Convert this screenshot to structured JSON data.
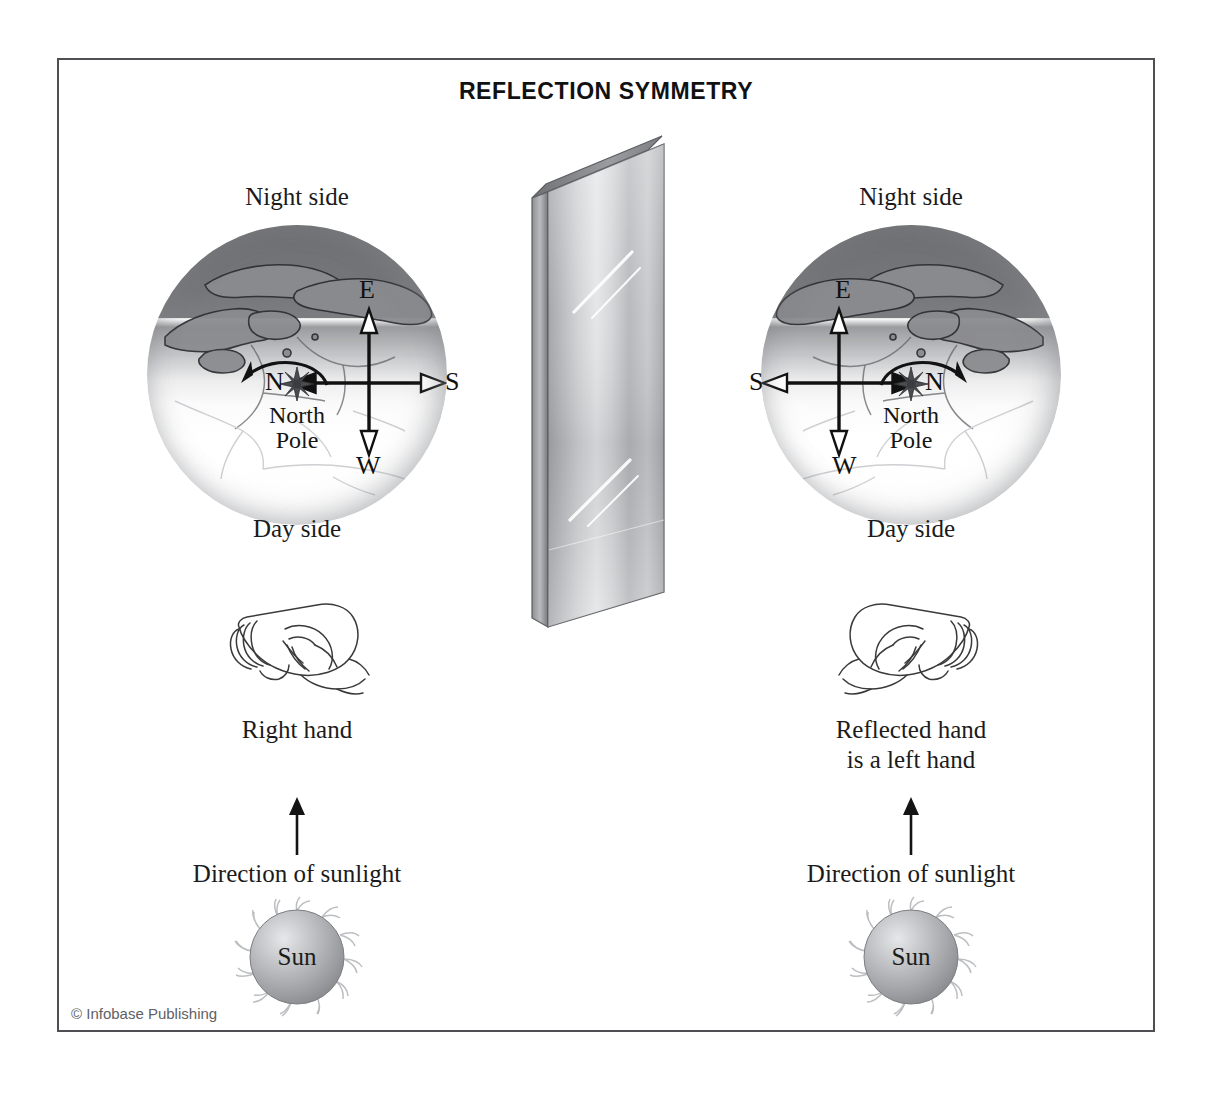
{
  "figure": {
    "title": "REFLECTION SYMMETRY",
    "credit": "© Infobase Publishing",
    "frame_color": "#4d4f52",
    "background": "#ffffff"
  },
  "left_panel": {
    "name": "original",
    "night_label": "Night side",
    "day_label": "Day side",
    "pole_label_line1": "North",
    "pole_label_line2": "Pole",
    "compass": {
      "up": "E",
      "down": "W",
      "left": "N",
      "right": "S"
    },
    "rotation_arrow_direction": "counterclockwise-to-left",
    "hand_caption_line1": "Right hand",
    "hand_caption_line2": "",
    "sunlight_label": "Direction of sunlight",
    "sun_label": "Sun"
  },
  "right_panel": {
    "name": "reflection",
    "night_label": "Night side",
    "day_label": "Day side",
    "pole_label_line1": "North",
    "pole_label_line2": "Pole",
    "compass": {
      "up": "E",
      "down": "W",
      "left": "S",
      "right": "N"
    },
    "rotation_arrow_direction": "clockwise-to-right",
    "hand_caption_line1": "Reflected hand",
    "hand_caption_line2": "is a left hand",
    "sunlight_label": "Direction of sunlight",
    "sun_label": "Sun"
  },
  "mirror": {
    "name": "mirror-panel",
    "highlight_count": 2
  },
  "colors": {
    "night": "#6f7073",
    "day": "#ffffff",
    "ink": "#1b1b1b",
    "mirror_light": "#e9eaec",
    "mirror_dark": "#8d8f93",
    "sun_body": "#a9abae"
  }
}
